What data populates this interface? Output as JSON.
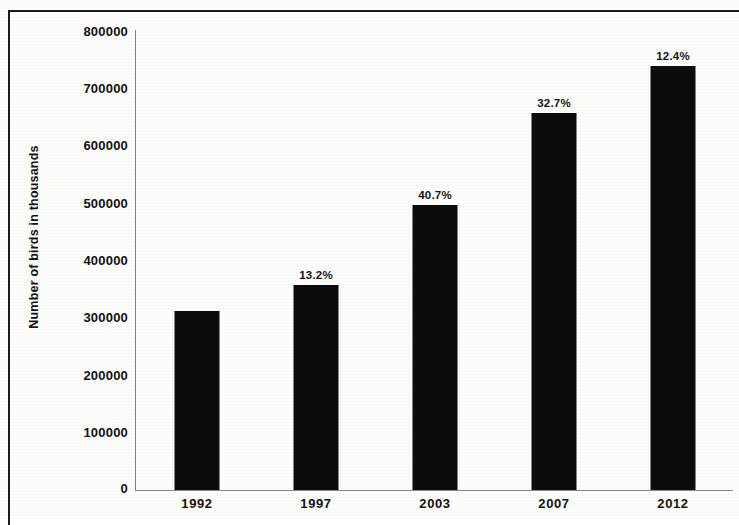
{
  "chart_data": {
    "type": "bar",
    "title": "",
    "xlabel": "",
    "ylabel": "Number of birds in thousands",
    "categories": [
      "1992",
      "1997",
      "2003",
      "2007",
      "2012"
    ],
    "values": [
      310000,
      355000,
      495000,
      655000,
      735000
    ],
    "point_labels": [
      "",
      "13.2%",
      "40.7%",
      "32.7%",
      "12.4%"
    ],
    "ylim": [
      0,
      800000
    ],
    "y_ticks": [
      0,
      100000,
      200000,
      300000,
      400000,
      500000,
      600000,
      700000,
      800000
    ],
    "y_tick_labels": [
      "0",
      "100000",
      "200000",
      "300000",
      "400000",
      "500000",
      "600000",
      "700000",
      "800000"
    ],
    "grid": false,
    "legend": false,
    "legend_position": "none",
    "bar_color": "#0c0c0c",
    "background_color": "#fdfdfb",
    "axis_color": "#7d7d7d",
    "annotations": [
      {
        "category": "1997",
        "text": "13.2%"
      },
      {
        "category": "2003",
        "text": "40.7%"
      },
      {
        "category": "2007",
        "text": "32.7%"
      },
      {
        "category": "2012",
        "text": "12.4%"
      }
    ]
  },
  "axis": {
    "y_title": "Number of birds in thousands"
  }
}
